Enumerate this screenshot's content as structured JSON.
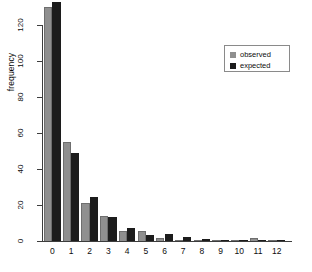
{
  "chart_data": {
    "type": "bar",
    "title": "",
    "subtitle": "",
    "xlabel": "",
    "ylabel": "frequency",
    "categories": [
      "0",
      "1",
      "2",
      "3",
      "4",
      "5",
      "6",
      "7",
      "8",
      "9",
      "10",
      "11",
      "12"
    ],
    "series": [
      {
        "name": "observed",
        "color": "#8f8f8f",
        "values": [
          130,
          55,
          21,
          14,
          5.5,
          5.5,
          1.5,
          0.3,
          0.8,
          0.3,
          0.2,
          1.5,
          0.5
        ]
      },
      {
        "name": "expected",
        "color": "#1c1c1c",
        "values": [
          133,
          49,
          24.5,
          13.5,
          7,
          3.5,
          4,
          2,
          1,
          0.5,
          0.2,
          0.5,
          0.5
        ]
      }
    ],
    "ylim": [
      0,
      133
    ],
    "yticks": [
      0,
      20,
      40,
      60,
      80,
      100,
      120
    ],
    "ytick_labels": [
      "0",
      "20",
      "40",
      "60",
      "80",
      "100",
      "120"
    ],
    "xlim": [
      "0",
      "12"
    ],
    "grid": false,
    "legend_position": "top-right",
    "legend_entries": [
      {
        "label": "observed",
        "color": "#8f8f8f"
      },
      {
        "label": "expected",
        "color": "#1c1c1c"
      }
    ]
  },
  "axes": {
    "y_title": "frequency"
  }
}
